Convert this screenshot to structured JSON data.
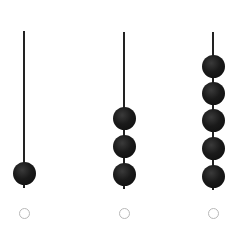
{
  "options": [
    {
      "id": "abacus-1",
      "bead_count": 1,
      "rod_x": 24,
      "rod_top": 31,
      "rod_bottom": 188,
      "bead_centers_y": [
        173
      ],
      "radio_selected": false
    },
    {
      "id": "abacus-2",
      "bead_count": 3,
      "rod_x": 124,
      "rod_top": 32,
      "rod_bottom": 189,
      "bead_centers_y": [
        118,
        146,
        174
      ],
      "radio_selected": false
    },
    {
      "id": "abacus-3",
      "bead_count": 5,
      "rod_x": 213,
      "rod_top": 32,
      "rod_bottom": 190,
      "bead_centers_y": [
        66,
        93,
        120,
        148,
        176
      ],
      "radio_selected": false
    }
  ],
  "radio_y": 213,
  "colors": {
    "bead": "#111111",
    "rod": "#222222",
    "radio_border": "#b8b8b8"
  }
}
